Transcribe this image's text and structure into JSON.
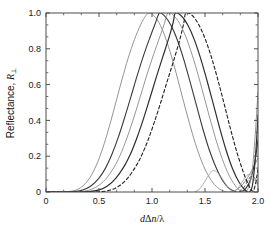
{
  "chart_data": {
    "type": "line",
    "title": "",
    "xlabel": "dΔn/λ",
    "ylabel": "Reflectance, R⊥",
    "xlim": [
      0,
      2.0
    ],
    "ylim": [
      0,
      1.0
    ],
    "xticks": [
      "0",
      "0.5",
      "1.0",
      "1.5",
      "2.0"
    ],
    "xtick_values": [
      0,
      0.5,
      1.0,
      1.5,
      2.0
    ],
    "yticks": [
      "0",
      "0.2",
      "0.4",
      "0.6",
      "0.8",
      "1.0"
    ],
    "ytick_values": [
      0,
      0.2,
      0.4,
      0.6,
      0.8,
      1.0
    ],
    "grid": false,
    "legend": "none",
    "minor_ticks_per_interval": 2,
    "series": [
      {
        "name": "curve-1",
        "style": "solid",
        "color": "#888888",
        "width": 0.9,
        "peak_x": 0.97,
        "peak_y": 1.0,
        "points": [
          [
            0.0,
            0.0
          ],
          [
            0.1,
            0.0
          ],
          [
            0.2,
            0.002
          ],
          [
            0.28,
            0.01
          ],
          [
            0.34,
            0.03
          ],
          [
            0.4,
            0.068
          ],
          [
            0.46,
            0.13
          ],
          [
            0.52,
            0.218
          ],
          [
            0.58,
            0.33
          ],
          [
            0.64,
            0.458
          ],
          [
            0.7,
            0.592
          ],
          [
            0.76,
            0.718
          ],
          [
            0.82,
            0.828
          ],
          [
            0.88,
            0.918
          ],
          [
            0.93,
            0.975
          ],
          [
            0.97,
            1.0
          ],
          [
            1.02,
            0.985
          ],
          [
            1.08,
            0.93
          ],
          [
            1.14,
            0.84
          ],
          [
            1.2,
            0.724
          ],
          [
            1.26,
            0.592
          ],
          [
            1.32,
            0.456
          ],
          [
            1.38,
            0.328
          ],
          [
            1.44,
            0.216
          ],
          [
            1.5,
            0.128
          ],
          [
            1.56,
            0.064
          ],
          [
            1.62,
            0.024
          ],
          [
            1.68,
            0.004
          ],
          [
            1.73,
            0.0
          ],
          [
            1.79,
            0.01
          ],
          [
            1.85,
            0.038
          ],
          [
            1.9,
            0.078
          ],
          [
            1.95,
            0.13
          ],
          [
            2.0,
            0.19
          ]
        ]
      },
      {
        "name": "curve-2",
        "style": "solid",
        "color": "#3a3a3a",
        "width": 1.1,
        "peak_x": 1.07,
        "peak_y": 1.0,
        "points": [
          [
            0.0,
            0.0
          ],
          [
            0.15,
            0.0
          ],
          [
            0.26,
            0.002
          ],
          [
            0.34,
            0.01
          ],
          [
            0.42,
            0.032
          ],
          [
            0.5,
            0.078
          ],
          [
            0.56,
            0.132
          ],
          [
            0.62,
            0.208
          ],
          [
            0.68,
            0.302
          ],
          [
            0.74,
            0.412
          ],
          [
            0.8,
            0.53
          ],
          [
            0.86,
            0.65
          ],
          [
            0.92,
            0.762
          ],
          [
            0.98,
            0.862
          ],
          [
            1.03,
            0.94
          ],
          [
            1.07,
            1.0
          ],
          [
            1.12,
            0.982
          ],
          [
            1.18,
            0.93
          ],
          [
            1.24,
            0.848
          ],
          [
            1.3,
            0.74
          ],
          [
            1.36,
            0.614
          ],
          [
            1.42,
            0.482
          ],
          [
            1.48,
            0.352
          ],
          [
            1.54,
            0.236
          ],
          [
            1.6,
            0.142
          ],
          [
            1.66,
            0.07
          ],
          [
            1.72,
            0.024
          ],
          [
            1.78,
            0.002
          ],
          [
            1.83,
            0.0
          ],
          [
            1.88,
            0.016
          ],
          [
            1.93,
            0.07
          ],
          [
            1.97,
            0.168
          ],
          [
            2.0,
            0.29
          ]
        ]
      },
      {
        "name": "curve-3",
        "style": "solid",
        "color": "#8a8a8a",
        "width": 0.9,
        "peak_x": 1.15,
        "peak_y": 1.0,
        "points": [
          [
            0.0,
            0.0
          ],
          [
            0.2,
            0.0
          ],
          [
            0.32,
            0.002
          ],
          [
            0.4,
            0.01
          ],
          [
            0.48,
            0.03
          ],
          [
            0.56,
            0.07
          ],
          [
            0.64,
            0.136
          ],
          [
            0.7,
            0.206
          ],
          [
            0.76,
            0.296
          ],
          [
            0.82,
            0.4
          ],
          [
            0.88,
            0.514
          ],
          [
            0.94,
            0.632
          ],
          [
            1.0,
            0.742
          ],
          [
            1.06,
            0.844
          ],
          [
            1.11,
            0.928
          ],
          [
            1.15,
            1.0
          ],
          [
            1.2,
            0.988
          ],
          [
            1.26,
            0.942
          ],
          [
            1.32,
            0.866
          ],
          [
            1.38,
            0.764
          ],
          [
            1.44,
            0.644
          ],
          [
            1.5,
            0.512
          ],
          [
            1.56,
            0.382
          ],
          [
            1.62,
            0.26
          ],
          [
            1.68,
            0.158
          ],
          [
            1.74,
            0.078
          ],
          [
            1.8,
            0.024
          ],
          [
            1.85,
            0.002
          ],
          [
            1.9,
            0.012
          ],
          [
            1.94,
            0.096
          ],
          [
            1.97,
            0.29
          ],
          [
            2.0,
            0.56
          ]
        ]
      },
      {
        "name": "curve-4",
        "style": "solid",
        "color": "#2e2e2e",
        "width": 1.2,
        "peak_x": 1.22,
        "peak_y": 1.0,
        "points": [
          [
            0.0,
            0.0
          ],
          [
            0.28,
            0.0
          ],
          [
            0.4,
            0.002
          ],
          [
            0.5,
            0.012
          ],
          [
            0.58,
            0.034
          ],
          [
            0.66,
            0.078
          ],
          [
            0.74,
            0.146
          ],
          [
            0.8,
            0.216
          ],
          [
            0.86,
            0.306
          ],
          [
            0.92,
            0.41
          ],
          [
            0.98,
            0.524
          ],
          [
            1.04,
            0.64
          ],
          [
            1.1,
            0.752
          ],
          [
            1.16,
            0.862
          ],
          [
            1.2,
            0.948
          ],
          [
            1.22,
            1.0
          ],
          [
            1.28,
            0.982
          ],
          [
            1.34,
            0.93
          ],
          [
            1.4,
            0.85
          ],
          [
            1.46,
            0.744
          ],
          [
            1.52,
            0.62
          ],
          [
            1.58,
            0.488
          ],
          [
            1.64,
            0.354
          ],
          [
            1.7,
            0.232
          ],
          [
            1.76,
            0.13
          ],
          [
            1.82,
            0.056
          ],
          [
            1.88,
            0.01
          ],
          [
            1.92,
            0.0
          ],
          [
            1.95,
            0.046
          ],
          [
            1.98,
            0.23
          ],
          [
            2.0,
            0.43
          ]
        ]
      },
      {
        "name": "curve-5-dashed",
        "style": "dashed",
        "color": "#1f1f1f",
        "width": 1.1,
        "peak_x": 1.32,
        "peak_y": 1.0,
        "points": [
          [
            0.0,
            0.0
          ],
          [
            0.4,
            0.0
          ],
          [
            0.52,
            0.002
          ],
          [
            0.6,
            0.01
          ],
          [
            0.68,
            0.03
          ],
          [
            0.76,
            0.07
          ],
          [
            0.84,
            0.136
          ],
          [
            0.9,
            0.202
          ],
          [
            0.96,
            0.286
          ],
          [
            1.02,
            0.386
          ],
          [
            1.08,
            0.496
          ],
          [
            1.14,
            0.612
          ],
          [
            1.2,
            0.726
          ],
          [
            1.26,
            0.846
          ],
          [
            1.3,
            0.944
          ],
          [
            1.32,
            1.0
          ],
          [
            1.38,
            0.986
          ],
          [
            1.44,
            0.936
          ],
          [
            1.5,
            0.858
          ],
          [
            1.56,
            0.754
          ],
          [
            1.62,
            0.63
          ],
          [
            1.68,
            0.494
          ],
          [
            1.74,
            0.354
          ],
          [
            1.8,
            0.224
          ],
          [
            1.86,
            0.114
          ],
          [
            1.91,
            0.04
          ],
          [
            1.95,
            0.004
          ],
          [
            1.97,
            0.03
          ],
          [
            1.99,
            0.09
          ],
          [
            2.0,
            0.125
          ]
        ]
      },
      {
        "name": "sidelobe-a",
        "style": "solid",
        "color": "#9a9a9a",
        "width": 0.8,
        "peak_x": 1.57,
        "peak_y": 0.12,
        "points": [
          [
            1.4,
            0.0
          ],
          [
            1.44,
            0.012
          ],
          [
            1.48,
            0.042
          ],
          [
            1.52,
            0.08
          ],
          [
            1.56,
            0.112
          ],
          [
            1.58,
            0.12
          ],
          [
            1.62,
            0.108
          ],
          [
            1.66,
            0.076
          ],
          [
            1.7,
            0.04
          ],
          [
            1.74,
            0.012
          ],
          [
            1.78,
            0.0
          ]
        ]
      },
      {
        "name": "sidelobe-b",
        "style": "solid",
        "color": "#9a9a9a",
        "width": 0.8,
        "peak_x": 1.9,
        "peak_y": 0.1,
        "points": [
          [
            1.76,
            0.0
          ],
          [
            1.8,
            0.014
          ],
          [
            1.84,
            0.046
          ],
          [
            1.88,
            0.082
          ],
          [
            1.91,
            0.098
          ],
          [
            1.94,
            0.092
          ],
          [
            1.97,
            0.066
          ],
          [
            2.0,
            0.034
          ]
        ]
      },
      {
        "name": "sidelobe-c-dashed",
        "style": "dashed",
        "color": "#3a3a3a",
        "width": 0.8,
        "peak_x": 1.93,
        "peak_y": 0.09,
        "points": [
          [
            1.82,
            0.0
          ],
          [
            1.86,
            0.02
          ],
          [
            1.9,
            0.058
          ],
          [
            1.93,
            0.086
          ],
          [
            1.96,
            0.084
          ],
          [
            1.98,
            0.066
          ],
          [
            2.0,
            0.046
          ]
        ]
      }
    ]
  },
  "axes": {
    "x_label_main": "d",
    "x_label_delta": "Δ",
    "x_label_n": "n",
    "x_label_slash": "/",
    "x_label_lambda": "λ",
    "y_label_main": "Reflectance, ",
    "y_label_R": "R",
    "y_label_perp": "⊥"
  },
  "style": {
    "frame_color": "#4d4d4d",
    "text_color": "#111111",
    "background": "#ffffff"
  }
}
